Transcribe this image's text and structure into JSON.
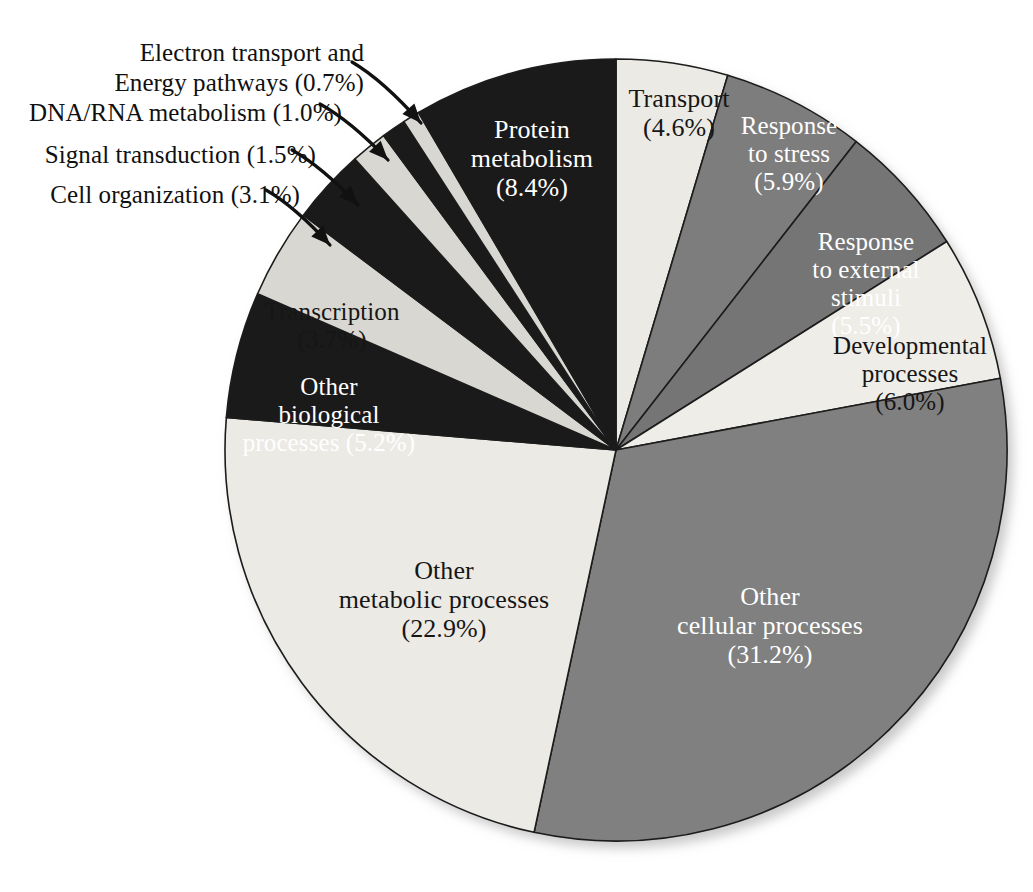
{
  "figure": {
    "background_color": "#ffffff",
    "outline_color": "#1c1c1c"
  },
  "palette": {
    "light": "#eceae5",
    "light_alt": "#e2e0da",
    "gray": "#7d7d7d",
    "gray_dark": "#6f6f6f",
    "black": "#1a1a1a",
    "text_dark": "#161616",
    "text_light": "#ffffff"
  },
  "chart_data": {
    "type": "pie",
    "title": "",
    "subtitle": "",
    "xlabel": "",
    "ylabel": "",
    "legend_position": "none",
    "grid": false,
    "units": "percent",
    "start_angle_deg": 0,
    "direction": "clockwise",
    "categories": [
      "Transport",
      "Response to stress",
      "Response to external stimuli",
      "Developmental processes",
      "Other cellular processes",
      "Other metabolic processes",
      "Other biological processes",
      "Transcription",
      "Cell organization",
      "Signal transduction",
      "DNA/RNA metabolism",
      "Electron transport and Energy pathways",
      "Protein metabolism"
    ],
    "values": [
      4.6,
      5.9,
      5.5,
      6.0,
      31.2,
      22.9,
      5.2,
      3.7,
      3.1,
      1.5,
      1.0,
      0.7,
      8.4
    ],
    "slices": [
      {
        "name": "transport",
        "label": "Transport",
        "label_lines": "Transport\n(4.6%)",
        "value": 4.6,
        "value_text": "(4.6%)",
        "fill": "#eceae5",
        "text_color": "#161616",
        "label_placement": "inside"
      },
      {
        "name": "response-to-stress",
        "label": "Response to stress",
        "label_lines": "Response\nto stress\n(5.9%)",
        "value": 5.9,
        "value_text": "(5.9%)",
        "fill": "#7d7d7d",
        "text_color": "#ffffff",
        "label_placement": "inside"
      },
      {
        "name": "response-to-external-stimuli",
        "label": "Response to external stimuli",
        "label_lines": "Response\nto external\nstimuli\n(5.5%)",
        "value": 5.5,
        "value_text": "(5.5%)",
        "fill": "#757575",
        "text_color": "#ffffff",
        "label_placement": "inside"
      },
      {
        "name": "developmental-processes",
        "label": "Developmental processes",
        "label_lines": "Developmental\nprocesses\n(6.0%)",
        "value": 6.0,
        "value_text": "(6.0%)",
        "fill": "#efede8",
        "text_color": "#161616",
        "label_placement": "inside"
      },
      {
        "name": "other-cellular-processes",
        "label": "Other cellular processes",
        "label_lines": "Other\ncellular processes\n(31.2%)",
        "value": 31.2,
        "value_text": "(31.2%)",
        "fill": "#808080",
        "text_color": "#ffffff",
        "label_placement": "inside"
      },
      {
        "name": "other-metabolic-processes",
        "label": "Other metabolic processes",
        "label_lines": "Other\nmetabolic processes\n(22.9%)",
        "value": 22.9,
        "value_text": "(22.9%)",
        "fill": "#eceae5",
        "text_color": "#161616",
        "label_placement": "inside"
      },
      {
        "name": "other-biological-processes",
        "label": "Other biological processes",
        "label_lines": "Other\nbiological\nprocesses  (5.2%)",
        "value": 5.2,
        "value_text": "(5.2%)",
        "fill": "#1a1a1a",
        "text_color": "#ffffff",
        "label_placement": "inside"
      },
      {
        "name": "transcription",
        "label": "Transcription",
        "label_lines": "Transcription\n(3.7%)",
        "value": 3.7,
        "value_text": "(3.7%)",
        "fill": "#d9d7d1",
        "text_color": "#161616",
        "label_placement": "inside"
      },
      {
        "name": "cell-organization",
        "label": "Cell organization",
        "label_lines": "Cell organization (3.1%)",
        "value": 3.1,
        "value_text": "(3.1%)",
        "fill": "#1a1a1a",
        "text_color": "#101010",
        "label_placement": "callout"
      },
      {
        "name": "signal-transduction",
        "label": "Signal transduction",
        "label_lines": "Signal transduction (1.5%)",
        "value": 1.5,
        "value_text": "(1.5%)",
        "fill": "#d9d7d1",
        "text_color": "#101010",
        "label_placement": "callout"
      },
      {
        "name": "dna-rna-metabolism",
        "label": "DNA/RNA metabolism",
        "label_lines": "DNA/RNA metabolism (1.0%)",
        "value": 1.0,
        "value_text": "(1.0%)",
        "fill": "#1a1a1a",
        "text_color": "#101010",
        "label_placement": "callout"
      },
      {
        "name": "electron-transport-energy-pathways",
        "label": "Electron transport and Energy pathways",
        "label_lines": "Electron transport and\nEnergy pathways (0.7%)",
        "value": 0.7,
        "value_text": "(0.7%)",
        "fill": "#d9d7d1",
        "text_color": "#101010",
        "label_placement": "callout"
      },
      {
        "name": "protein-metabolism",
        "label": "Protein metabolism",
        "label_lines": "Protein\nmetabolism\n(8.4%)",
        "value": 8.4,
        "value_text": "(8.4%)",
        "fill": "#1a1a1a",
        "text_color": "#ffffff",
        "label_placement": "inside"
      }
    ],
    "callouts": [
      {
        "name": "electron-transport-energy-pathways",
        "text": "Electron transport and\nEnergy pathways (0.7%)"
      },
      {
        "name": "dna-rna-metabolism",
        "text": "DNA/RNA metabolism (1.0%)"
      },
      {
        "name": "signal-transduction",
        "text": "Signal transduction (1.5%)"
      },
      {
        "name": "cell-organization",
        "text": "Cell organization (3.1%)"
      }
    ]
  }
}
